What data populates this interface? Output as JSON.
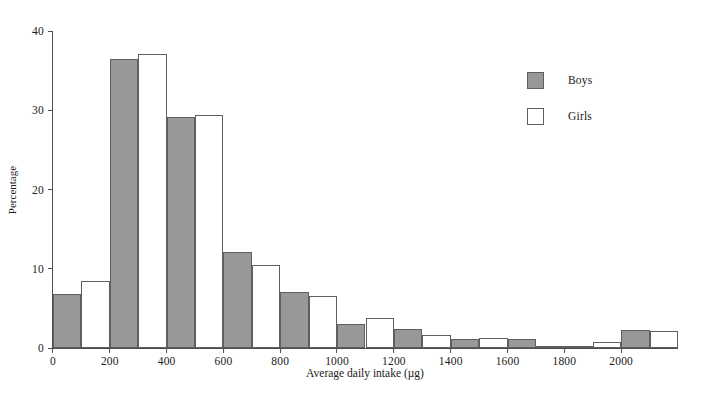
{
  "chart_data": {
    "type": "bar",
    "title": "",
    "subtitle": "",
    "xlabel": "Average daily intake (µg)",
    "ylabel": "Percentage",
    "xlim": [
      0,
      2200
    ],
    "ylim": [
      0,
      40
    ],
    "grid": false,
    "legend_position": "top-right",
    "bin_width": 200,
    "bin_starts": [
      0,
      200,
      400,
      600,
      800,
      1000,
      1200,
      1400,
      1600,
      1800,
      2000
    ],
    "categories": [
      "0-200",
      "200-400",
      "400-600",
      "600-800",
      "800-1000",
      "1000-1200",
      "1200-1400",
      "1400-1600",
      "1600-1800",
      "1800-2000",
      "2000+"
    ],
    "series": [
      {
        "name": "Boys",
        "color": "#989898",
        "values": [
          6.8,
          36.5,
          29.1,
          12.1,
          7.1,
          3.0,
          2.4,
          1.1,
          1.2,
          0.2,
          2.3
        ]
      },
      {
        "name": "Girls",
        "color": "#ffffff",
        "values": [
          8.4,
          37.1,
          29.4,
          10.5,
          6.6,
          3.8,
          1.6,
          1.3,
          0.2,
          0.8,
          2.2
        ]
      }
    ],
    "yticks": [
      0,
      10,
      20,
      30,
      40
    ],
    "ytick_labels": [
      "0",
      "10",
      "20",
      "30",
      "40"
    ],
    "xticks": [
      0,
      200,
      400,
      600,
      800,
      1000,
      1200,
      1400,
      1600,
      1800,
      2000
    ],
    "xtick_labels": [
      "0",
      "200",
      "400",
      "600",
      "800",
      "1000",
      "1200",
      "1400",
      "1600",
      "1800",
      "2000"
    ]
  },
  "legend": {
    "items": [
      {
        "label": "Boys"
      },
      {
        "label": "Girls"
      }
    ]
  },
  "colors": {
    "boys_fill": "#989898",
    "girls_fill": "#ffffff",
    "bar_stroke": "#5f5f5f",
    "axis": "#4d4d4d",
    "text": "#1a1a1a",
    "background": "#ffffff"
  }
}
